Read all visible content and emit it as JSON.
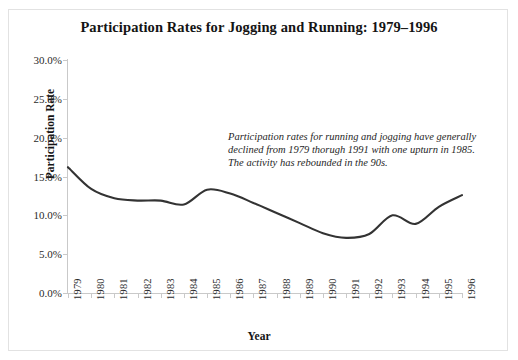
{
  "chart_data": {
    "type": "line",
    "title": "Participation Rates for Jogging and Running: 1979–1996",
    "xlabel": "Year",
    "ylabel": "Participation Rate",
    "categories": [
      "1979",
      "1980",
      "1981",
      "1982",
      "1983",
      "1984",
      "1985",
      "1986",
      "1987",
      "1988",
      "1989",
      "1990",
      "1991",
      "1992",
      "1993",
      "1994",
      "1995",
      "1996"
    ],
    "values": [
      16.2,
      13.4,
      12.2,
      11.9,
      11.9,
      11.4,
      13.3,
      12.8,
      11.6,
      10.3,
      9.0,
      7.7,
      7.1,
      7.6,
      10.0,
      8.9,
      11.1,
      12.6
    ],
    "y_tick_labels": [
      "0.0%",
      "5.0%",
      "10.0%",
      "15.0%",
      "20.0%",
      "25.0%",
      "30.0%"
    ],
    "y_ticks": [
      0,
      5,
      10,
      15,
      20,
      25,
      30
    ],
    "ylim": [
      0,
      30
    ],
    "xlim": [
      "1979",
      "1996"
    ],
    "grid": false,
    "legend": false,
    "series": [
      {
        "name": "Participation Rate",
        "color": "#333333",
        "values": [
          16.2,
          13.4,
          12.2,
          11.9,
          11.9,
          11.4,
          13.3,
          12.8,
          11.6,
          10.3,
          9.0,
          7.7,
          7.1,
          7.6,
          10.0,
          8.9,
          11.1,
          12.6
        ]
      }
    ],
    "annotations": [
      {
        "name": "trend-note",
        "text": "Participation rates for running and jogging have generally declined from 1979 thorugh 1991 with one upturn in 1985. The activity has rebounded in the 90s."
      }
    ],
    "colors": {
      "line": "#333333",
      "axis": "#c9c9c9",
      "text": "#1a1a1a",
      "background": "#ffffff",
      "border": "#e2e2e2"
    }
  }
}
